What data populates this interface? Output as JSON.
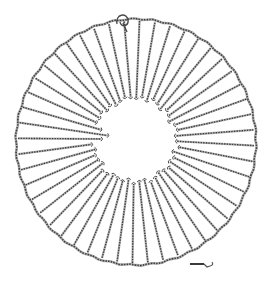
{
  "figure": {
    "ink_color": "#6e6e6e",
    "background": "#ffffff",
    "outer_ring": {
      "cx": 136,
      "cy": 142,
      "rx": 120,
      "ry": 123
    },
    "inner_hole": {
      "cx": 135,
      "cy": 140,
      "r": 42
    },
    "spoke_count": 48,
    "inner_radius_variation": [
      0,
      2,
      -1,
      3,
      1,
      -2,
      2,
      0,
      -3,
      1,
      2,
      -1,
      0,
      3,
      -2,
      1,
      -1,
      2,
      0,
      -2,
      1,
      3,
      -1,
      0,
      2,
      -2,
      1,
      0,
      -1,
      2,
      3,
      -2,
      0,
      1,
      -1,
      2,
      -8,
      -14,
      -6,
      1,
      0,
      2,
      -1,
      1,
      -2,
      0,
      2,
      1
    ],
    "clasp": {
      "x": 123,
      "y": 20
    },
    "scale_bar": {
      "x1": 190,
      "y1": 264,
      "x2": 204,
      "y2": 264,
      "hook_x": 212,
      "hook_y": 266
    }
  }
}
